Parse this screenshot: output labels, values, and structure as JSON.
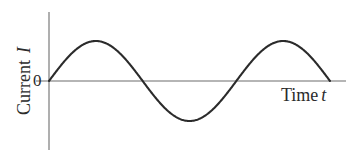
{
  "figure": {
    "background_color": "#ffffff",
    "curve_color": "#2b2b2b",
    "axis_color": "#6d6d6d"
  },
  "labels": {
    "origin": "0",
    "x_axis_word": "Time",
    "x_axis_symbol": "t",
    "y_axis_word": "Current",
    "y_axis_symbol": "I"
  },
  "chart_data": {
    "type": "line",
    "title": "",
    "xlabel": "Time t",
    "ylabel": "Current I",
    "grid": false,
    "legend": "none",
    "annotations": [
      "0"
    ],
    "axis_ranges": {
      "x": [
        0,
        1.5
      ],
      "y": [
        -1.35,
        1.35
      ]
    },
    "x_tick_labels": [],
    "y_tick_labels": [
      "0"
    ],
    "series": [
      {
        "name": "Current I(t)",
        "function": "sin",
        "amplitude": 1,
        "periods_shown": 1.5,
        "phase": 0,
        "x": [
          0,
          0.0625,
          0.125,
          0.1875,
          0.25,
          0.3125,
          0.375,
          0.4375,
          0.5,
          0.5625,
          0.625,
          0.6875,
          0.75,
          0.8125,
          0.875,
          0.9375,
          1.0,
          1.0625,
          1.125,
          1.1875,
          1.25,
          1.3125,
          1.375,
          1.4375,
          1.5
        ],
        "y": [
          0,
          0.383,
          0.707,
          0.924,
          1.0,
          0.924,
          0.707,
          0.383,
          0,
          -0.383,
          -0.707,
          -0.924,
          -1.0,
          -0.924,
          -0.707,
          -0.383,
          0,
          0.383,
          0.707,
          0.924,
          1.0,
          0.924,
          0.707,
          0.383,
          0
        ]
      }
    ]
  }
}
